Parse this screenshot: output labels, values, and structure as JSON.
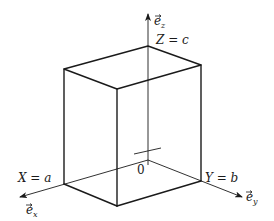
{
  "diagram": {
    "type": "3d-box-coordinate-system",
    "labels": {
      "z_axis": "e",
      "z_axis_sub": "z",
      "x_axis": "e",
      "x_axis_sub": "x",
      "y_axis": "e",
      "y_axis_sub": "y",
      "z_intercept": "Z = c",
      "x_intercept": "X = a",
      "y_intercept": "Y = b",
      "origin": "0"
    },
    "colors": {
      "stroke": "#1a1a1a",
      "background": "#ffffff"
    }
  }
}
